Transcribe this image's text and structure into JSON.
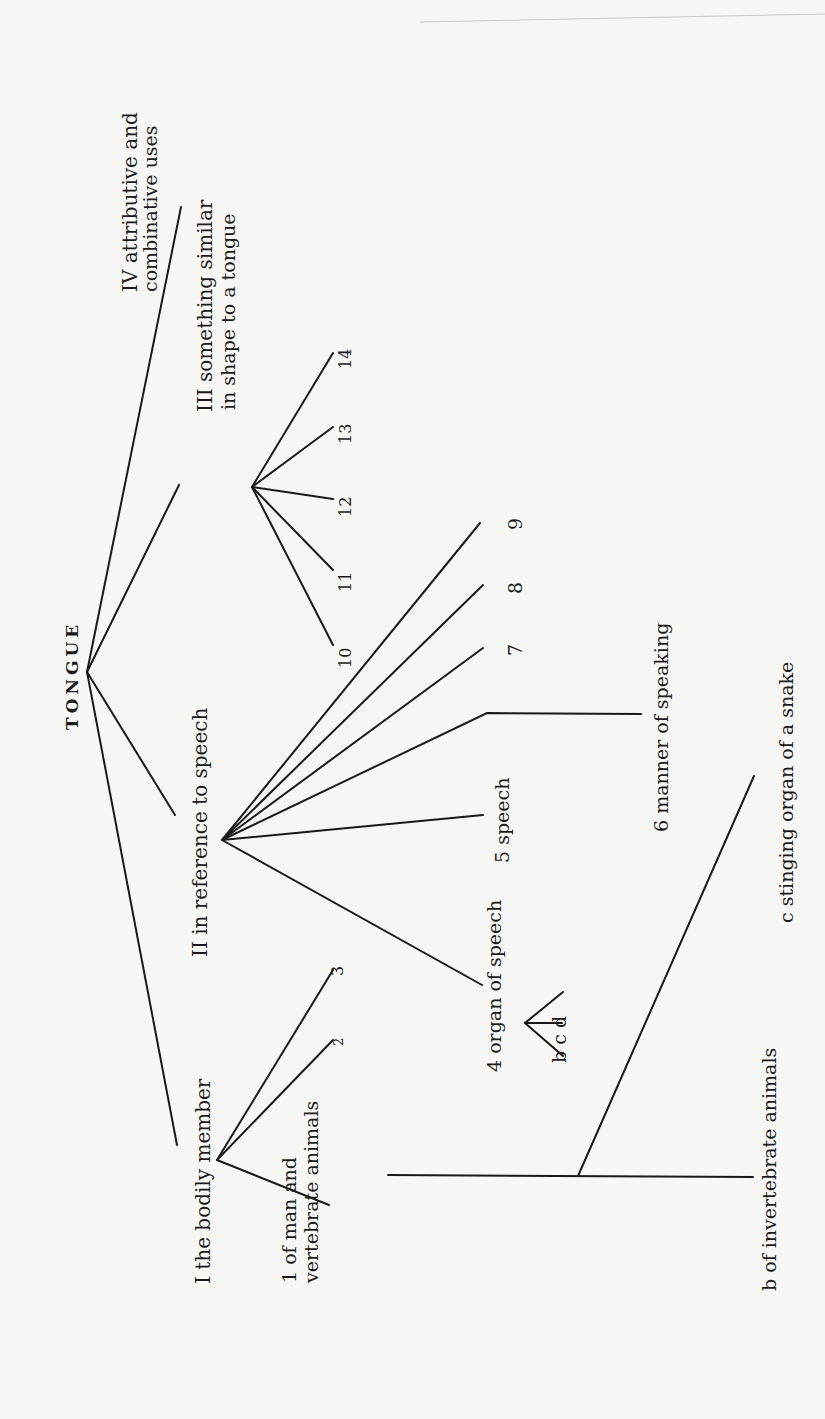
{
  "diagram": {
    "orientation": "rotated-90-counterclockwise",
    "root": {
      "label": "TONGUE"
    },
    "branches": [
      {
        "id": "I",
        "label": "I the bodily member",
        "children": [
          {
            "id": "1",
            "label_line1": "1 of man and",
            "label_line2": "vertebrate animals"
          },
          {
            "id": "2",
            "label": "2"
          },
          {
            "id": "3",
            "label": "3"
          }
        ]
      },
      {
        "id": "II",
        "label": "II in reference to speech",
        "children": [
          {
            "id": "4",
            "label": "4 organ of speech",
            "sub": "b c d"
          },
          {
            "id": "5",
            "label": "5 speech"
          },
          {
            "id": "6",
            "label": "6 manner of speaking"
          },
          {
            "id": "7",
            "label": "7"
          },
          {
            "id": "8",
            "label": "8"
          },
          {
            "id": "9",
            "label": "9"
          }
        ]
      },
      {
        "id": "III",
        "label_line1": "III something similar",
        "label_line2": "in shape to a tongue",
        "children": [
          {
            "id": "10",
            "label": "10"
          },
          {
            "id": "11",
            "label": "11"
          },
          {
            "id": "12",
            "label": "12"
          },
          {
            "id": "13",
            "label": "13"
          },
          {
            "id": "14",
            "label": "14"
          }
        ]
      },
      {
        "id": "IV",
        "label_line1": "IV attributive and",
        "label_line2": "combinative uses"
      }
    ],
    "extra": {
      "b_invertebrate": "b of invertebrate animals",
      "c_snake": "c stinging organ of a snake"
    }
  }
}
